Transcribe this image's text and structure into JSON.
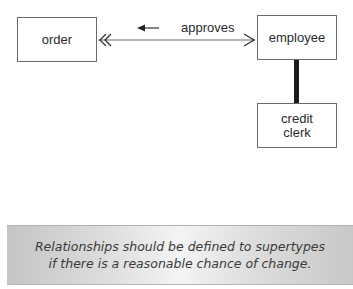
{
  "diagram": {
    "entities": [
      {
        "id": "order",
        "label": "order"
      },
      {
        "id": "employee",
        "label": "employee"
      },
      {
        "id": "clerk",
        "label_lines": [
          "credit",
          "clerk"
        ]
      }
    ],
    "relationship": {
      "label": "approves",
      "direction_arrow": "left",
      "from": "order",
      "to": "employee",
      "order_end": "double-chevron (many)",
      "employee_end": "single-chevron (one)"
    },
    "subtype_link": {
      "parent": "employee",
      "child": "credit clerk",
      "style": "thick-bar"
    }
  },
  "banner": {
    "lines": [
      "Relationships should be defined to supertypes",
      "if there is a reasonable chance of change."
    ]
  }
}
